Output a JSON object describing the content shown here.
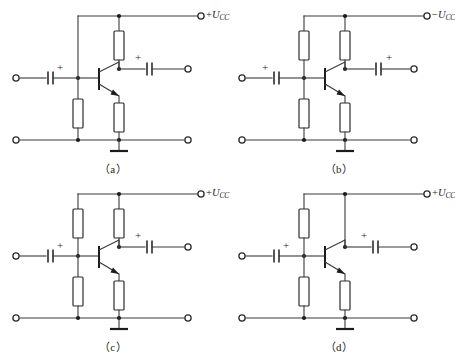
{
  "figure": {
    "panel_count": 4,
    "width": 451,
    "height": 357,
    "background_color": "#ffffff",
    "wire_color": "#3a3a3a",
    "device_color": "#2b2b2b",
    "text_color": "#231f20"
  },
  "panels": [
    {
      "id": "a",
      "caption": "（a）",
      "supply_label_sign": "+",
      "supply_label_var": "U",
      "supply_label_sub": "CC",
      "supply_label_full": "+UCC",
      "has_upper_left_resistor": false,
      "has_collector_resistor": true,
      "has_lower_left_resistor": true,
      "has_emitter_resistor": true,
      "transistor_type": "npn",
      "input_cap_plus_side": "right",
      "output_cap_plus_side": "left",
      "input_cap_plus": "+",
      "output_cap_plus": "+",
      "ground_present": true,
      "terminals": [
        "input",
        "output",
        "input-return",
        "output-return",
        "supply"
      ]
    },
    {
      "id": "b",
      "caption": "（b）",
      "supply_label_sign": "−",
      "supply_label_var": "U",
      "supply_label_sub": "CC",
      "supply_label_full": "−UCC",
      "has_upper_left_resistor": true,
      "has_collector_resistor": true,
      "has_lower_left_resistor": true,
      "has_emitter_resistor": true,
      "transistor_type": "pnp",
      "input_cap_plus_side": "left",
      "output_cap_plus_side": "right",
      "input_cap_plus": "+",
      "output_cap_plus": "+",
      "ground_present": true,
      "terminals": [
        "input",
        "output",
        "input-return",
        "output-return",
        "supply"
      ]
    },
    {
      "id": "c",
      "caption": "（c）",
      "supply_label_sign": "+",
      "supply_label_var": "U",
      "supply_label_sub": "CC",
      "supply_label_full": "+UCC",
      "has_upper_left_resistor": true,
      "has_collector_resistor": true,
      "has_lower_left_resistor": true,
      "has_emitter_resistor": true,
      "transistor_type": "npn",
      "input_cap_plus_side": "right",
      "output_cap_plus_side": "left",
      "input_cap_plus": "+",
      "output_cap_plus": "+",
      "ground_present": true,
      "terminals": [
        "input",
        "output",
        "input-return",
        "output-return",
        "supply"
      ]
    },
    {
      "id": "d",
      "caption": "（d）",
      "supply_label_sign": "+",
      "supply_label_var": "U",
      "supply_label_sub": "CC",
      "supply_label_full": "+UCC",
      "has_upper_left_resistor": true,
      "has_collector_resistor": false,
      "has_lower_left_resistor": true,
      "has_emitter_resistor": true,
      "transistor_type": "npn",
      "input_cap_plus_side": "right",
      "output_cap_plus_side": "left",
      "input_cap_plus": "+",
      "output_cap_plus": "+",
      "ground_present": true,
      "terminals": [
        "input",
        "output",
        "input-return",
        "output-return",
        "supply"
      ]
    }
  ]
}
